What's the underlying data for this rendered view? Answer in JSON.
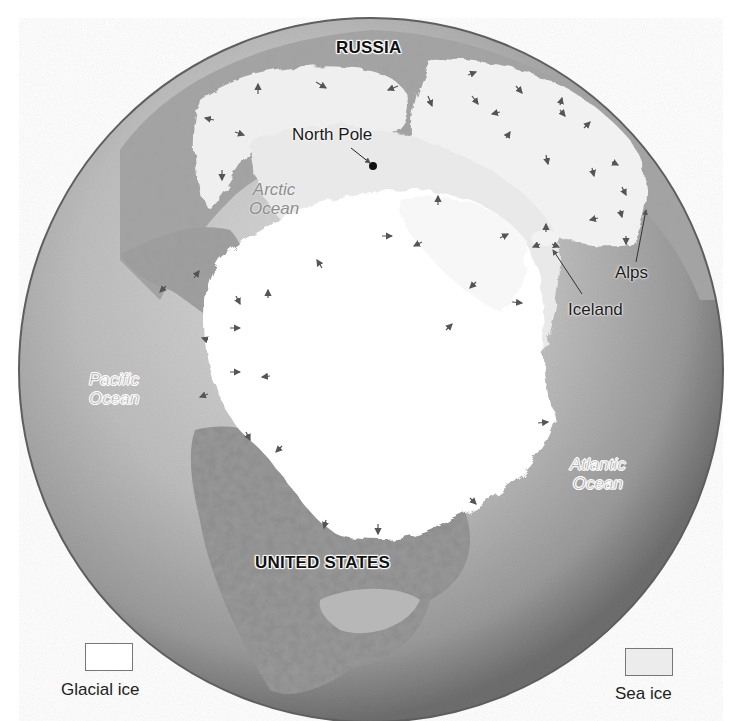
{
  "map": {
    "title": "Northern Hemisphere ice sheets during the last glacial maximum",
    "projection": "orthographic globe centered on the North Pole region",
    "colors": {
      "ocean_light": "#d6d6d6",
      "ocean_dark": "#6f6f6f",
      "land": "#9a9a9a",
      "glacial_ice": "#ffffff",
      "sea_ice": "#ececec"
    },
    "labels": {
      "russia": "RUSSIA",
      "north_pole": "North Pole",
      "arctic_ocean_line1": "Arctic",
      "arctic_ocean_line2": "Ocean",
      "alps": "Alps",
      "iceland": "Iceland",
      "pacific_ocean_line1": "Pacific",
      "pacific_ocean_line2": "Ocean",
      "atlantic_ocean_line1": "Atlantic",
      "atlantic_ocean_line2": "Ocean",
      "united_states": "UNITED STATES"
    }
  },
  "legend": {
    "items": [
      {
        "label": "Glacial ice",
        "swatch_color": "#ffffff"
      },
      {
        "label": "Sea ice",
        "swatch_color": "#ececec"
      }
    ]
  }
}
